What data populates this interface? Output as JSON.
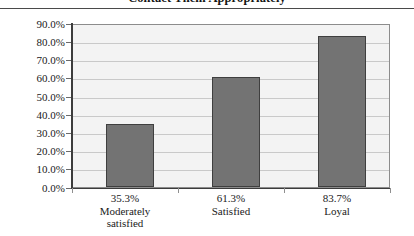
{
  "chart_data": {
    "type": "bar",
    "title": "Contact Them Appropriately",
    "xlabel": "",
    "ylabel": "",
    "ylim": [
      0,
      90
    ],
    "ytick_labels": [
      "90.0%",
      "80.0%",
      "70.0%",
      "60.0%",
      "50.0%",
      "40.0%",
      "30.0%",
      "20.0%",
      "10.0%",
      "0.0%"
    ],
    "ytick_values": [
      90,
      80,
      70,
      60,
      50,
      40,
      30,
      20,
      10,
      0
    ],
    "grid": true,
    "legend": "none",
    "categories": [
      "Moderately satisfied",
      "Satisfied",
      "Loyal"
    ],
    "values": [
      35.3,
      61.3,
      83.7
    ],
    "data_labels": [
      "35.3%",
      "61.3%",
      "83.7%"
    ],
    "category_lines": [
      [
        "Moderately",
        "satisfied"
      ],
      [
        "Satisfied"
      ],
      [
        "Loyal"
      ]
    ],
    "bar_color": "#737373",
    "bar_border_color": "#3f3f3f",
    "plot_background": "#f3f3f3",
    "gridline_color": "#c9c9c9",
    "axis_color": "#3c3c3c"
  }
}
